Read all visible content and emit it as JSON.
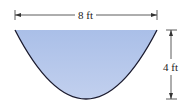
{
  "diagram": {
    "width_label": "8 ft",
    "height_label": "4 ft",
    "fill_color": "#b3c6ea",
    "outline_color": "#1a1a2e",
    "dimension_line_color": "#333333"
  }
}
